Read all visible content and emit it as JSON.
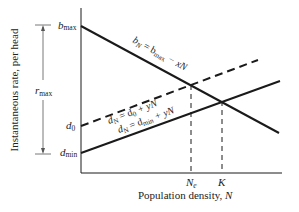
{
  "diagram": {
    "y_axis_label": "Instantaneous rate, per head",
    "x_axis_label": "Population density, ",
    "x_axis_var": "N",
    "r_max_label": "r",
    "r_max_sub": "max",
    "y_ticks": {
      "b_max": {
        "main": "b",
        "sub": "max"
      },
      "d_0": {
        "main": "d",
        "sub": "0"
      },
      "d_min": {
        "main": "d",
        "sub": "min"
      }
    },
    "x_ticks": {
      "N_e": {
        "main": "N",
        "sub": "e"
      },
      "K": {
        "main": "K"
      }
    },
    "lines": {
      "birth": {
        "lhs": "b",
        "lhs_sub": "N",
        "eq": " = b",
        "eq_sub": "max",
        "rest": " − xN",
        "style": "solid"
      },
      "death_dashed": {
        "lhs": "d",
        "lhs_sub": "N",
        "eq": " = d",
        "eq_sub": "0",
        "rest": " + yN",
        "style": "dashed"
      },
      "death_solid": {
        "lhs": "d",
        "lhs_sub": "N",
        "eq": " = d",
        "eq_sub": "min",
        "rest": " + yN",
        "style": "solid"
      }
    },
    "colors": {
      "line": "#1a1a1a",
      "background": "#ffffff"
    }
  }
}
